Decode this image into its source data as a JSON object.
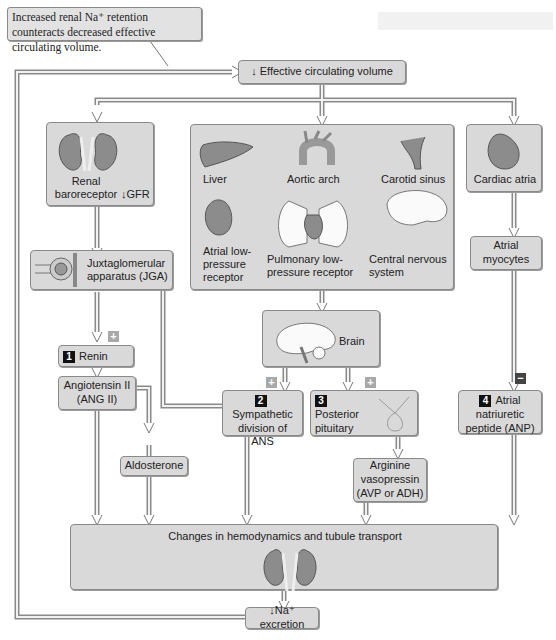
{
  "callout": {
    "text": "Increased renal Na⁺ retention counteracts decreased effective circulating volume."
  },
  "nodes": {
    "effective_volume": {
      "arrow": "↓",
      "label": "Effective circulating volume"
    },
    "renal_baroreceptor": {
      "label": "Renal baroreceptor",
      "gfr": "↓GFR"
    },
    "sensors": {
      "liver": "Liver",
      "aortic_arch": "Aortic arch",
      "carotid_sinus": "Carotid sinus",
      "atrial_low": "Atrial low-pressure receptor",
      "pulmonary_low": "Pulmonary low-pressure receptor",
      "cns": "Central nervous system"
    },
    "cardiac_atria": {
      "label": "Cardiac atria"
    },
    "jga": {
      "label": "Juxtaglomerular apparatus (JGA)"
    },
    "atrial_myocytes": {
      "label": "Atrial myocytes"
    },
    "brain": {
      "label": "Brain"
    },
    "renin": {
      "num": "1",
      "label": "Renin"
    },
    "ang2": {
      "label": "Angiotensin II (ANG II)"
    },
    "sympathetic": {
      "num": "2",
      "label": "Sympathetic division of ANS"
    },
    "posterior_pituitary": {
      "num": "3",
      "label": "Posterior pituitary"
    },
    "anp": {
      "num": "4",
      "label": "Atrial natriuretic peptide (ANP)"
    },
    "aldosterone": {
      "label": "Aldosterone"
    },
    "avp": {
      "label": "Arginine vasopressin (AVP or ADH)"
    },
    "changes": {
      "label": "Changes in hemodynamics and tubule transport"
    },
    "na_excretion": {
      "arrow": "↓",
      "label": "Na⁺ excretion"
    }
  },
  "signs": {
    "plus": "+",
    "minus": "−"
  }
}
